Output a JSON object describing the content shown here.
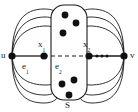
{
  "figure": {
    "type": "graph-diagram",
    "background_color": "#ffffff",
    "stroke_color": "#1a1a1a",
    "node_fill": "#111111",
    "width": 138,
    "height": 112
  },
  "labels": {
    "u": "u",
    "v": "v",
    "x1_base": "x",
    "x1_sub": "1",
    "x2_base": "x",
    "x2_sub": "2",
    "e1_base": "e",
    "e1_sub": "1",
    "e2_base": "e",
    "e2_sub": "2",
    "set": "S"
  },
  "graph_data": {
    "vertices": [
      {
        "id": "u",
        "label": "u",
        "x": 12,
        "y": 56,
        "r": 3.6,
        "in_set": false
      },
      {
        "id": "x1",
        "label": "x1",
        "x": 44,
        "y": 56,
        "r": 3.6,
        "in_set": true
      },
      {
        "id": "x2",
        "label": "x2",
        "x": 89,
        "y": 56,
        "r": 3.6,
        "in_set": true
      },
      {
        "id": "v",
        "label": "v",
        "x": 124,
        "y": 56,
        "r": 3.6,
        "in_set": false
      },
      {
        "id": "s1",
        "x": 65,
        "y": 15,
        "r": 3.4,
        "in_set": true
      },
      {
        "id": "s2",
        "x": 76,
        "y": 23,
        "r": 3.4,
        "in_set": true
      },
      {
        "id": "s3",
        "x": 63,
        "y": 33,
        "r": 3.4,
        "in_set": true
      },
      {
        "id": "s4",
        "x": 62,
        "y": 84,
        "r": 3.4,
        "in_set": true
      },
      {
        "id": "s5",
        "x": 74,
        "y": 80,
        "r": 3.4,
        "in_set": true
      },
      {
        "id": "s6",
        "x": 69,
        "y": 95,
        "r": 3.4,
        "in_set": true
      }
    ],
    "edges": [
      {
        "from": "u",
        "to": "x1",
        "style": "solid",
        "label": "e1"
      },
      {
        "from": "x1",
        "to": "x2",
        "style": "dashed",
        "label": "e2"
      },
      {
        "from": "x2",
        "to": "v",
        "style": "solid-with-ellipsis"
      }
    ],
    "curved_edges_left_upper": 3,
    "curved_edges_left_lower": 3,
    "curved_edges_right_upper": 3,
    "curved_edges_right_lower": 3,
    "ellipsis_dots": 3,
    "separator": {
      "label": "S",
      "shape": "rounded-rectangle",
      "x": 51,
      "y": 5,
      "width": 36,
      "height": 95,
      "radius": 12,
      "vertex_count": 8
    }
  }
}
